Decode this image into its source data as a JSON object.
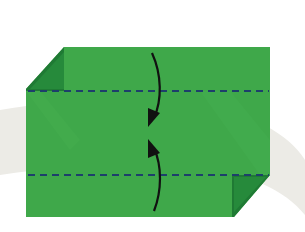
{
  "diagram": {
    "type": "origami-step",
    "colors": {
      "background": "#ffffff",
      "swoosh": "#ecebe6",
      "paper": "#3fa84a",
      "paper_shade": "#38a044",
      "flap_dark": "#1f7a34",
      "fold_line": "#1d3f6b",
      "arrow": "#111111"
    },
    "paper": {
      "x": 26,
      "y": 47,
      "width": 244,
      "height": 170
    },
    "fold_lines": [
      {
        "name": "upper-valley-fold",
        "y": 91,
        "style": "dashed"
      },
      {
        "name": "lower-valley-fold",
        "y": 175,
        "style": "dashed"
      }
    ],
    "arrows": [
      {
        "name": "fold-down-arrow",
        "from": "top",
        "to": "center",
        "direction": "down"
      },
      {
        "name": "fold-up-arrow",
        "from": "bottom",
        "to": "center",
        "direction": "up"
      }
    ],
    "corner_flaps": [
      {
        "name": "top-left-flap",
        "corner": "top-left"
      },
      {
        "name": "bottom-right-flap",
        "corner": "bottom-right"
      }
    ]
  }
}
